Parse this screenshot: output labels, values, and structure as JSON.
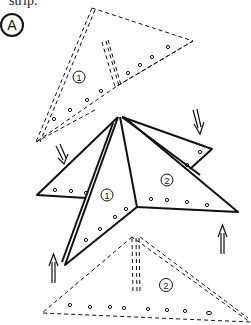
{
  "caption": "strip.",
  "step_label": "A",
  "pieces": {
    "top_piece_number": "1",
    "star_left_number": "1",
    "star_right_number": "2",
    "bottom_piece_number": "2"
  },
  "colors": {
    "ink": "#111111",
    "background": "#ffffff"
  }
}
